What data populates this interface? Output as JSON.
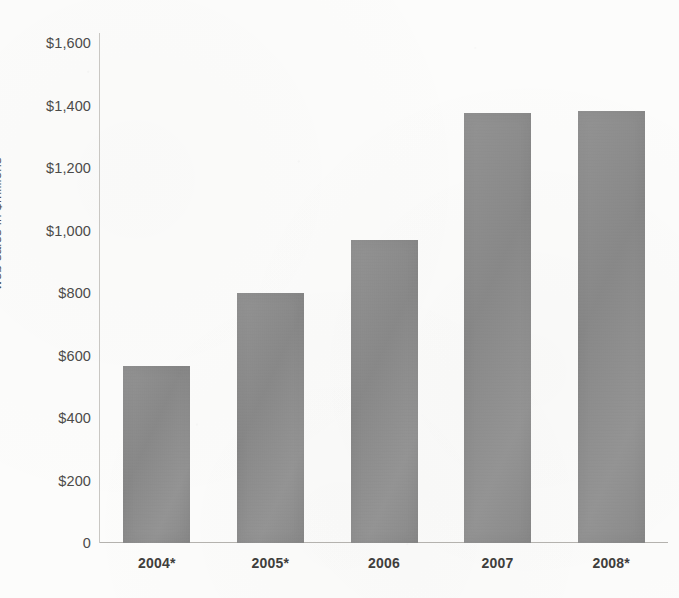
{
  "chart_data": {
    "type": "bar",
    "title": "",
    "xlabel": "",
    "ylabel": "web sales in $millions",
    "categories": [
      "2004*",
      "2005*",
      "2006",
      "2007",
      "2008*"
    ],
    "values": [
      568,
      800,
      970,
      1375,
      1382
    ],
    "ylim": [
      0,
      1600
    ],
    "ytick_labels": [
      "0",
      "$200",
      "$400",
      "$600",
      "$800",
      "$1,000",
      "$1,200",
      "$1,400",
      "$1,600"
    ],
    "ytick_values": [
      0,
      200,
      400,
      600,
      800,
      1000,
      1200,
      1400,
      1600
    ],
    "grid": false,
    "legend": null,
    "series": [
      {
        "name": "web sales",
        "values": [
          568,
          800,
          970,
          1375,
          1382
        ]
      }
    ],
    "bar_color": "#8d8d8d",
    "annotations": []
  },
  "axes": {
    "y_title": "web sales in $millions",
    "baseline_label": "0"
  },
  "colors": {
    "bar": "#8d8d8d",
    "axis": "#b4b2ae",
    "text": "#4c4b49",
    "background": "#fcfcfb"
  }
}
